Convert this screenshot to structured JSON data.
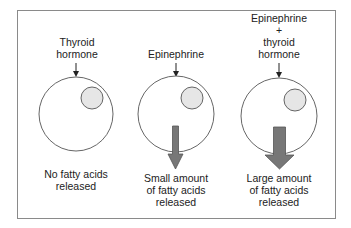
{
  "colors": {
    "frame": "#8a8a8a",
    "cell_outline": "#555555",
    "nucleus_fill": "#e6e6e6",
    "arrow_fill": "#777777",
    "arrow_stroke": "#555555",
    "text": "#222222"
  },
  "panels": [
    {
      "id": "thyroid",
      "input_label": [
        "Thyroid",
        "hormone"
      ],
      "output_label": [
        "No fatty acids",
        "released"
      ],
      "release_arrow": "none"
    },
    {
      "id": "epinephrine",
      "input_label": [
        "Epinephrine"
      ],
      "output_label": [
        "Small amount",
        "of fatty acids",
        "released"
      ],
      "release_arrow": "small"
    },
    {
      "id": "combined",
      "input_label": [
        "Epinephrine",
        "+",
        "thyroid",
        "hormone"
      ],
      "output_label": [
        "Large amount",
        "of fatty acids",
        "released"
      ],
      "release_arrow": "large"
    }
  ]
}
